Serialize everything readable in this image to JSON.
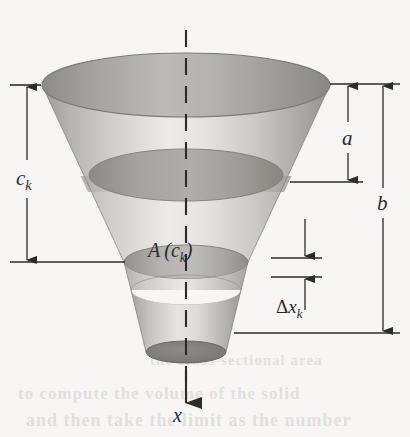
{
  "figure": {
    "kind": "geometry-diagram",
    "background_color": "#f7f6f4",
    "ink_color": "#2b2b2b",
    "labels": {
      "c_k": {
        "base": "c",
        "sub": "k"
      },
      "a": {
        "base": "a",
        "sub": ""
      },
      "b": {
        "base": "b",
        "sub": ""
      },
      "A_of_c_k": {
        "fn": "A",
        "open": "(",
        "base": "c",
        "sub": "k",
        "close": ")"
      },
      "delta_x_k": {
        "delta": "Δ",
        "base": "x",
        "sub": "k"
      },
      "axis": {
        "base": "x",
        "sub": ""
      }
    },
    "dimensions": [
      {
        "name": "c_k",
        "side": "left",
        "label": "c",
        "subscript": "k",
        "arrow": "double",
        "from_y": 85,
        "to_y": 262
      },
      {
        "name": "a",
        "side": "right",
        "label": "a",
        "subscript": "",
        "arrow": "double",
        "from_y": 84,
        "to_y": 182
      },
      {
        "name": "b",
        "side": "right",
        "label": "b",
        "subscript": "",
        "arrow": "double",
        "from_y": 84,
        "to_y": 333
      },
      {
        "name": "delta_x_k",
        "side": "right",
        "label": "Δx",
        "subscript": "k",
        "arrow": "double",
        "from_y": 243,
        "to_y": 272
      }
    ],
    "solid": {
      "shape": "funnel",
      "top_rim_center_x": 186,
      "top_rim_center_y": 85,
      "top_rim_rx": 144,
      "top_rim_ry": 32,
      "bottom_rim_center_y": 352,
      "bottom_rim_rx": 40,
      "bottom_rim_ry": 11,
      "cross_section_y": 262,
      "slab_top_y": 262,
      "slab_bottom_y": 290,
      "shade_light": "#e3e1de",
      "shade_mid": "#c8c6c2",
      "shade_dark": "#9a9894",
      "shade_darker": "#868480"
    },
    "axis": {
      "name": "x-axis",
      "style": "dashed-through-solid",
      "x": 186,
      "from_y": 30,
      "to_y": 420,
      "arrow": "down",
      "label": "x"
    },
    "bleed_text": {
      "line1": "to compute the volume of the solid",
      "line2": "and then take the limit as the number",
      "line3": "the cross-sectional area"
    }
  }
}
